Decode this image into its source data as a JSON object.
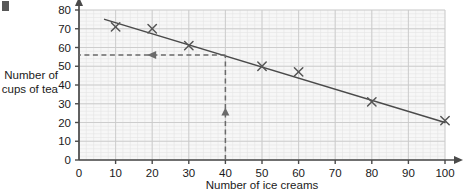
{
  "chart_data": {
    "type": "scatter",
    "title": "",
    "xlabel": "Number of ice creams",
    "ylabel": "Number of cups of tea",
    "ylabel_line1": "Number of",
    "ylabel_line2": "cups of tea",
    "xlim": [
      0,
      100
    ],
    "ylim": [
      0,
      80
    ],
    "xticks": [
      0,
      10,
      20,
      30,
      40,
      50,
      60,
      70,
      80,
      90,
      100
    ],
    "yticks": [
      0,
      10,
      20,
      30,
      40,
      50,
      60,
      70,
      80
    ],
    "xtick_labels": [
      "0",
      "10",
      "20",
      "30",
      "40",
      "50",
      "60",
      "70",
      "80",
      "90",
      "100"
    ],
    "ytick_labels": [
      "0",
      "10",
      "20",
      "30",
      "40",
      "50",
      "60",
      "70",
      "80"
    ],
    "grid": true,
    "grid_major_step_x": 10,
    "grid_major_step_y": 10,
    "grid_minor_step_x": 2,
    "grid_minor_step_y": 2,
    "legend": null,
    "marker": "x",
    "points": [
      {
        "x": 10,
        "y": 71
      },
      {
        "x": 20,
        "y": 70
      },
      {
        "x": 30,
        "y": 61
      },
      {
        "x": 50,
        "y": 50
      },
      {
        "x": 60,
        "y": 47
      },
      {
        "x": 80,
        "y": 31
      },
      {
        "x": 100,
        "y": 21
      }
    ],
    "series": [
      {
        "name": "data",
        "x": [
          10,
          20,
          30,
          50,
          60,
          80,
          100
        ],
        "values": [
          71,
          70,
          61,
          50,
          47,
          31,
          21
        ]
      }
    ],
    "trend_line": {
      "name": "line of best fit",
      "x_start": 7,
      "y_start": 75,
      "x_end": 100,
      "y_end": 20
    },
    "annotations": [
      {
        "name": "reading-vertical",
        "style": "dashed",
        "arrow": "up",
        "from": {
          "x": 40,
          "y": 0
        },
        "to": {
          "x": 40,
          "y": 56
        }
      },
      {
        "name": "reading-horizontal",
        "style": "dashed",
        "arrow": "left",
        "from": {
          "x": 40,
          "y": 56
        },
        "to": {
          "x": 0,
          "y": 56
        }
      }
    ],
    "reading": {
      "ice_creams": 40,
      "cups_of_tea": 56
    }
  },
  "colors": {
    "plot_background": "#f7f7f7",
    "grid_major": "#c9c9c9",
    "grid_minor": "#e4e4e4",
    "axis": "#4a4a4a",
    "marker": "#555555",
    "trend_line": "#4a4a4a",
    "dashed_guide": "#6a6a6a",
    "text": "#1a1a1a"
  }
}
